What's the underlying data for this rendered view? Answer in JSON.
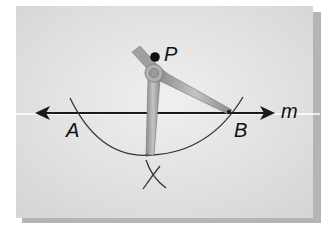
{
  "diagram": {
    "type": "geometric-construction",
    "labels": {
      "point_p": "P",
      "point_a": "A",
      "point_b": "B",
      "line_m": "m"
    },
    "colors": {
      "paper": "#e4e4e4",
      "shadow": "#b8b8b8",
      "ink": "#1a1a1a",
      "compass": "#9a9a9a"
    }
  }
}
